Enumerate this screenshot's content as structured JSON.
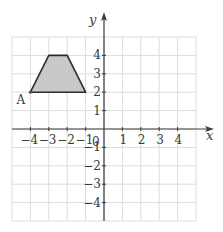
{
  "figure": {
    "x_axis_label": "x",
    "y_axis_label": "y",
    "origin_label": "0",
    "x_ticks": [
      {
        "value": -4,
        "label": "−4"
      },
      {
        "value": -3,
        "label": "−3"
      },
      {
        "value": -2,
        "label": "−2"
      },
      {
        "value": -1,
        "label": "−1"
      },
      {
        "value": 1,
        "label": "1"
      },
      {
        "value": 2,
        "label": "2"
      },
      {
        "value": 3,
        "label": "3"
      },
      {
        "value": 4,
        "label": "4"
      }
    ],
    "y_ticks": [
      {
        "value": 4,
        "label": "4"
      },
      {
        "value": 3,
        "label": "3"
      },
      {
        "value": 2,
        "label": "2"
      },
      {
        "value": 1,
        "label": "1"
      },
      {
        "value": -1,
        "label": "−1"
      },
      {
        "value": -2,
        "label": "−2"
      },
      {
        "value": -3,
        "label": "−3"
      },
      {
        "value": -4,
        "label": "−4"
      }
    ],
    "grid_range": {
      "x": [
        -5,
        5
      ],
      "y": [
        -5,
        5
      ]
    },
    "shape": {
      "name": "trapezium",
      "vertices": [
        [
          -4,
          2
        ],
        [
          -3,
          4
        ],
        [
          -2,
          4
        ],
        [
          -1,
          2
        ]
      ],
      "fill": "#c8c8c8",
      "stroke": "#2a2a2a"
    },
    "point_label": {
      "text": "A",
      "at": [
        -4,
        2
      ]
    },
    "colors": {
      "grid": "#dcdcdc",
      "axis": "#3a3a3a",
      "background": "#ffffff"
    }
  }
}
